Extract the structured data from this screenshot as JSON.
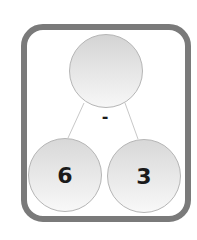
{
  "diagram": {
    "type": "number-bond",
    "top": {
      "value": ""
    },
    "operator": "-",
    "parts": [
      {
        "value": "6"
      },
      {
        "value": "3"
      }
    ],
    "colors": {
      "frame": "#7a7a7a",
      "circle_border": "#b5b5b5",
      "lines": "#c8c8c8",
      "text": "#1a1a1a"
    }
  }
}
